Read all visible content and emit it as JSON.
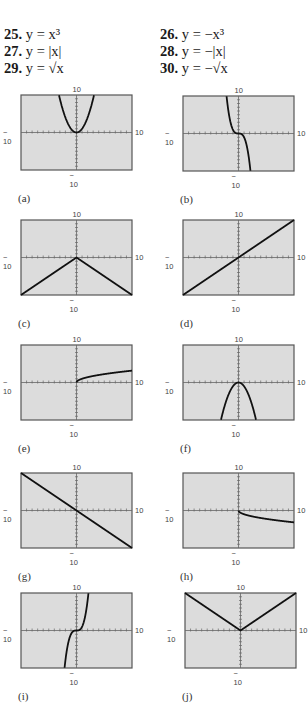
{
  "exercises": [
    {
      "num": "25.",
      "expr": "y = x³"
    },
    {
      "num": "26.",
      "expr": "y = −x³"
    },
    {
      "num": "27.",
      "expr": "y = |x|"
    },
    {
      "num": "28.",
      "expr": "y = −|x|"
    },
    {
      "num": "29.",
      "expr": "y = √x"
    },
    {
      "num": "30.",
      "expr": "y = −√x"
    }
  ],
  "window": {
    "xmin": "− 10",
    "xmax": "10",
    "ymin": "− 10",
    "ymax": "10"
  },
  "panels": [
    {
      "caption": "(a)",
      "func": "x^2"
    },
    {
      "caption": "(b)",
      "func": "-x^3"
    },
    {
      "caption": "(c)",
      "func": "-|x|"
    },
    {
      "caption": "(d)",
      "func": "x"
    },
    {
      "caption": "(e)",
      "func": "sqrt(x)"
    },
    {
      "caption": "(f)",
      "func": "-x^2"
    },
    {
      "caption": "(g)",
      "func": "-x"
    },
    {
      "caption": "(h)",
      "func": "-sqrt(x)"
    },
    {
      "caption": "(i)",
      "func": "x^3"
    },
    {
      "caption": "(j)",
      "func": "|x|"
    }
  ],
  "colors": {
    "screen": "#dcdcdc",
    "frame": "#555555",
    "curve": "#111111"
  },
  "chart_data": [
    {
      "type": "line",
      "title": "(a)",
      "x_range": [
        -10,
        10
      ],
      "y_range": [
        -10,
        10
      ],
      "series": [
        {
          "name": "y=x^2",
          "x": [
            -3.2,
            -2,
            -1,
            0,
            1,
            2,
            3.2
          ],
          "y": [
            10,
            4,
            1,
            0,
            1,
            4,
            10
          ]
        }
      ]
    },
    {
      "type": "line",
      "title": "(b)",
      "x_range": [
        -10,
        10
      ],
      "y_range": [
        -10,
        10
      ],
      "series": [
        {
          "name": "y=-x^3",
          "x": [
            -2.15,
            -1,
            0,
            1,
            2.15
          ],
          "y": [
            10,
            1,
            0,
            -1,
            -10
          ]
        }
      ]
    },
    {
      "type": "line",
      "title": "(c)",
      "x_range": [
        -10,
        10
      ],
      "y_range": [
        -10,
        10
      ],
      "series": [
        {
          "name": "y=-|x|",
          "x": [
            -10,
            0,
            10
          ],
          "y": [
            -10,
            0,
            -10
          ]
        }
      ]
    },
    {
      "type": "line",
      "title": "(d)",
      "x_range": [
        -10,
        10
      ],
      "y_range": [
        -10,
        10
      ],
      "series": [
        {
          "name": "y=x",
          "x": [
            -10,
            10
          ],
          "y": [
            -10,
            10
          ]
        }
      ]
    },
    {
      "type": "line",
      "title": "(e)",
      "x_range": [
        -10,
        10
      ],
      "y_range": [
        -10,
        10
      ],
      "series": [
        {
          "name": "y=sqrt(x)",
          "x": [
            0,
            1,
            4,
            10
          ],
          "y": [
            0,
            1,
            2,
            3.16
          ]
        }
      ]
    },
    {
      "type": "line",
      "title": "(f)",
      "x_range": [
        -10,
        10
      ],
      "y_range": [
        -10,
        10
      ],
      "series": [
        {
          "name": "y=-x^2",
          "x": [
            -3.2,
            -2,
            0,
            2,
            3.2
          ],
          "y": [
            -10,
            -4,
            0,
            -4,
            -10
          ]
        }
      ]
    },
    {
      "type": "line",
      "title": "(g)",
      "x_range": [
        -10,
        10
      ],
      "y_range": [
        -10,
        10
      ],
      "series": [
        {
          "name": "y=-x",
          "x": [
            -10,
            10
          ],
          "y": [
            10,
            -10
          ]
        }
      ]
    },
    {
      "type": "line",
      "title": "(h)",
      "x_range": [
        -10,
        10
      ],
      "y_range": [
        -10,
        10
      ],
      "series": [
        {
          "name": "y=-sqrt(x)",
          "x": [
            0,
            1,
            4,
            10
          ],
          "y": [
            0,
            -1,
            -2,
            -3.16
          ]
        }
      ]
    },
    {
      "type": "line",
      "title": "(i)",
      "x_range": [
        -10,
        10
      ],
      "y_range": [
        -10,
        10
      ],
      "series": [
        {
          "name": "y=x^3",
          "x": [
            -2.15,
            -1,
            0,
            1,
            2.15
          ],
          "y": [
            -10,
            -1,
            0,
            1,
            10
          ]
        }
      ]
    },
    {
      "type": "line",
      "title": "(j)",
      "x_range": [
        -10,
        10
      ],
      "y_range": [
        -10,
        10
      ],
      "series": [
        {
          "name": "y=|x|",
          "x": [
            -10,
            0,
            10
          ],
          "y": [
            10,
            0,
            10
          ]
        }
      ]
    }
  ]
}
